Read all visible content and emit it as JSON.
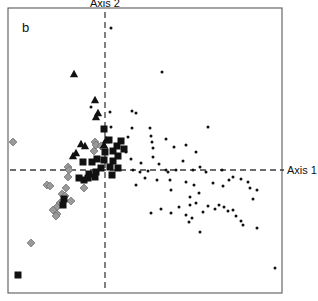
{
  "figure": {
    "panel_label": "b",
    "axis1_label": "Axis 1",
    "axis2_label": "Axis 2",
    "background_color": "#ffffff",
    "frame_color": "#5a5a5a",
    "axis_color": "#3d3d3d"
  },
  "chart_data": {
    "type": "scatter",
    "title": "b",
    "xlabel": "Axis 1",
    "ylabel": "Axis 2",
    "grid": false,
    "legend_position": "none",
    "axis_style": "dashed crosshair at origin",
    "xlim": [
      -1.0,
      1.0
    ],
    "ylim": [
      -1.0,
      1.0
    ],
    "origin_px": {
      "x": 105,
      "y": 170
    },
    "frame_px": {
      "left": 8,
      "top": 8,
      "right": 282,
      "bottom": 293
    },
    "colors": {
      "black_square": "#111111",
      "black_triangle": "#111111",
      "gray_diamond": "#9a9a9a",
      "small_dot": "#111111"
    },
    "series": [
      {
        "name": "black-squares",
        "marker": "square",
        "color": "#111111",
        "size": 7,
        "count": 26,
        "points_px": [
          [
            104,
            129
          ],
          [
            109,
            140
          ],
          [
            117,
            146
          ],
          [
            121,
            141
          ],
          [
            124,
            149
          ],
          [
            113,
            151
          ],
          [
            105,
            152
          ],
          [
            118,
            156
          ],
          [
            104,
            160
          ],
          [
            113,
            161
          ],
          [
            97,
            159
          ],
          [
            92,
            162
          ],
          [
            83,
            162
          ],
          [
            110,
            167
          ],
          [
            101,
            168
          ],
          [
            118,
            168
          ],
          [
            96,
            172
          ],
          [
            112,
            175
          ],
          [
            89,
            174
          ],
          [
            95,
            177
          ],
          [
            88,
            178
          ],
          [
            79,
            178
          ],
          [
            84,
            180
          ],
          [
            64,
            199
          ],
          [
            63,
            205
          ],
          [
            18,
            275
          ]
        ]
      },
      {
        "name": "black-triangles",
        "marker": "triangle",
        "color": "#111111",
        "size": 7,
        "count": 10,
        "points_px": [
          [
            74,
            74
          ],
          [
            95,
            100
          ],
          [
            98,
            113
          ],
          [
            96,
            117
          ],
          [
            106,
            140
          ],
          [
            81,
            144
          ],
          [
            85,
            146
          ],
          [
            104,
            145
          ],
          [
            76,
            153
          ],
          [
            73,
            156
          ]
        ]
      },
      {
        "name": "gray-diamonds",
        "marker": "diamond",
        "color": "#9a9a9a",
        "size": 7,
        "count": 22,
        "points_px": [
          [
            13,
            142
          ],
          [
            95,
            142
          ],
          [
            96,
            145
          ],
          [
            94,
            151
          ],
          [
            101,
            146
          ],
          [
            104,
            148
          ],
          [
            68,
            167
          ],
          [
            69,
            170
          ],
          [
            68,
            177
          ],
          [
            47,
            185
          ],
          [
            50,
            186
          ],
          [
            66,
            188
          ],
          [
            84,
            188
          ],
          [
            62,
            194
          ],
          [
            65,
            196
          ],
          [
            71,
            201
          ],
          [
            60,
            203
          ],
          [
            57,
            207
          ],
          [
            53,
            210
          ],
          [
            57,
            214
          ],
          [
            56,
            216
          ],
          [
            31,
            243
          ]
        ]
      },
      {
        "name": "small-dots",
        "marker": "circle",
        "color": "#111111",
        "size": 3,
        "count": 74,
        "points_px": [
          [
            111,
            28
          ],
          [
            162,
            72
          ],
          [
            91,
            107
          ],
          [
            132,
            111
          ],
          [
            136,
            113
          ],
          [
            110,
            112
          ],
          [
            111,
            127
          ],
          [
            132,
            128
          ],
          [
            150,
            128
          ],
          [
            208,
            127
          ],
          [
            128,
            137
          ],
          [
            151,
            136
          ],
          [
            152,
            142
          ],
          [
            166,
            139
          ],
          [
            153,
            148
          ],
          [
            126,
            152
          ],
          [
            174,
            147
          ],
          [
            186,
            145
          ],
          [
            196,
            152
          ],
          [
            153,
            157
          ],
          [
            131,
            159
          ],
          [
            141,
            163
          ],
          [
            159,
            164
          ],
          [
            183,
            161
          ],
          [
            166,
            170
          ],
          [
            133,
            170
          ],
          [
            140,
            172
          ],
          [
            148,
            171
          ],
          [
            168,
            172
          ],
          [
            176,
            170
          ],
          [
            193,
            170
          ],
          [
            200,
            167
          ],
          [
            206,
            172
          ],
          [
            222,
            170
          ],
          [
            145,
            178
          ],
          [
            157,
            180
          ],
          [
            170,
            180
          ],
          [
            186,
            182
          ],
          [
            233,
            177
          ],
          [
            136,
            185
          ],
          [
            194,
            185
          ],
          [
            213,
            183
          ],
          [
            223,
            186
          ],
          [
            229,
            180
          ],
          [
            241,
            179
          ],
          [
            248,
            182
          ],
          [
            250,
            188
          ],
          [
            171,
            190
          ],
          [
            199,
            193
          ],
          [
            257,
            190
          ],
          [
            190,
            197
          ],
          [
            253,
            199
          ],
          [
            161,
            209
          ],
          [
            179,
            207
          ],
          [
            190,
            205
          ],
          [
            196,
            203
          ],
          [
            203,
            212
          ],
          [
            208,
            206
          ],
          [
            215,
            209
          ],
          [
            219,
            205
          ],
          [
            224,
            207
          ],
          [
            228,
            211
          ],
          [
            233,
            210
          ],
          [
            151,
            213
          ],
          [
            171,
            213
          ],
          [
            186,
            215
          ],
          [
            192,
            218
          ],
          [
            189,
            222
          ],
          [
            236,
            216
          ],
          [
            241,
            221
          ],
          [
            243,
            225
          ],
          [
            257,
            228
          ],
          [
            200,
            232
          ],
          [
            275,
            268
          ]
        ]
      }
    ]
  }
}
